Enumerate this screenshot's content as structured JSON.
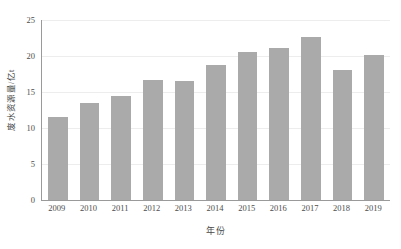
{
  "chart_data": {
    "type": "bar",
    "title": "",
    "subtitle": "",
    "xlabel": "年份",
    "ylabel": "废水资源量/亿t",
    "categories": [
      "2009",
      "2010",
      "2011",
      "2012",
      "2013",
      "2014",
      "2015",
      "2016",
      "2017",
      "2018",
      "2019"
    ],
    "values": [
      11.5,
      13.5,
      14.4,
      16.6,
      16.5,
      18.8,
      20.5,
      21.1,
      22.7,
      18.0,
      20.1
    ],
    "series": [
      {
        "name": "废水资源量",
        "values": [
          11.5,
          13.5,
          14.4,
          16.6,
          16.5,
          18.8,
          20.5,
          21.1,
          22.7,
          18.0,
          20.1
        ]
      }
    ],
    "ylim": [
      0,
      25
    ],
    "yticks": [
      0,
      5,
      10,
      15,
      20,
      25
    ],
    "ytick_labels": [
      "0",
      "5",
      "10",
      "15",
      "20",
      "25"
    ],
    "xtick_labels": [
      "2009",
      "2010",
      "2011",
      "2012",
      "2013",
      "2014",
      "2015",
      "2016",
      "2017",
      "2018",
      "2019"
    ],
    "grid": true,
    "grid_axis": "y",
    "legend": false,
    "legend_position": "none",
    "bar_color": "#aaaaaa",
    "axis_color": "#9a9a9a",
    "grid_color": "#ededed",
    "background_color": "#ffffff",
    "annotations": []
  }
}
